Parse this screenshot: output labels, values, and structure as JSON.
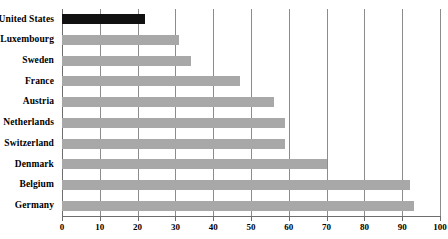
{
  "chart_data": {
    "type": "bar",
    "orientation": "horizontal",
    "title": "",
    "subtitle": "",
    "xlabel": "",
    "ylabel": "",
    "xlim": [
      0,
      100
    ],
    "grid": true,
    "legend": false,
    "legend_position": "none",
    "categories": [
      "United States",
      "Luxembourg",
      "Sweden",
      "France",
      "Austria",
      "Netherlands",
      "Switzerland",
      "Denmark",
      "Belgium",
      "Germany"
    ],
    "values": [
      22,
      31,
      34,
      47,
      56,
      59,
      59,
      70,
      92,
      93
    ],
    "bar_colors": [
      "#111111",
      "#a8a8a8",
      "#a8a8a8",
      "#a8a8a8",
      "#a8a8a8",
      "#a8a8a8",
      "#a8a8a8",
      "#a8a8a8",
      "#a8a8a8",
      "#a8a8a8"
    ],
    "xticks": [
      0,
      10,
      20,
      30,
      40,
      50,
      60,
      70,
      80,
      90,
      100
    ],
    "xtick_labels": [
      "0",
      "10",
      "20",
      "30",
      "40",
      "50",
      "60",
      "70",
      "80",
      "90",
      "100"
    ],
    "colors": {
      "highlight_bar": "#111111",
      "default_bar": "#a8a8a8",
      "gridline": "#8c8c8c",
      "axis": "#6e6e6e",
      "background": "#ffffff",
      "text": "#000000"
    }
  }
}
